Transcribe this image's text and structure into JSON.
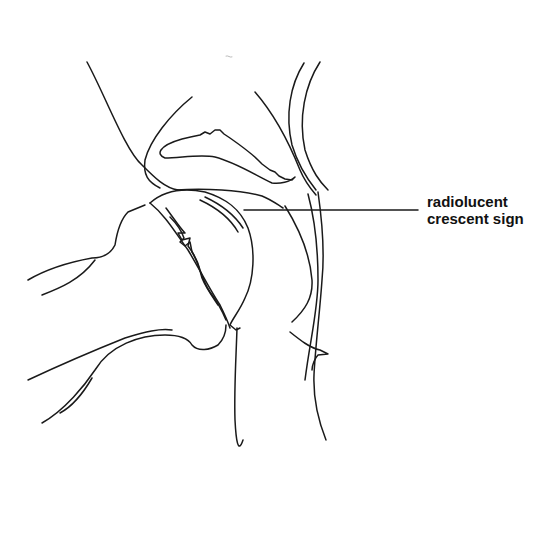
{
  "diagram": {
    "type": "anatomical line drawing",
    "annotation": {
      "line1": "radiolucent",
      "line2": "crescent sign"
    },
    "colors": {
      "stroke": "#1a1a1a",
      "background": "#ffffff",
      "text": "#111111"
    }
  }
}
